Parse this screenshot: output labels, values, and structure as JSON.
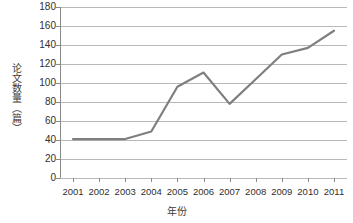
{
  "chart_data": {
    "type": "line",
    "title": "",
    "xlabel": "年份",
    "ylabel": "论文数量（篇）",
    "categories": [
      "2001",
      "2002",
      "2003",
      "2004",
      "2005",
      "2006",
      "2007",
      "2008",
      "2009",
      "2010",
      "2011"
    ],
    "values": [
      41,
      41,
      41,
      49,
      96,
      111,
      78,
      104,
      130,
      137,
      155
    ],
    "series": [
      {
        "name": "论文数量",
        "values": [
          41,
          41,
          41,
          49,
          96,
          111,
          78,
          104,
          130,
          137,
          155
        ],
        "color": "#7f7f7f"
      }
    ],
    "ylim": [
      0,
      180
    ],
    "ytick_step": 20,
    "yticks": [
      0,
      20,
      40,
      60,
      80,
      100,
      120,
      140,
      160,
      180
    ],
    "ytick_labels": [
      "0",
      "20",
      "40",
      "60",
      "80",
      "100",
      "120",
      "140",
      "160",
      "180"
    ],
    "grid": true,
    "grid_axis": "y",
    "legend": false,
    "legend_position": "none",
    "markers": false,
    "colors": {
      "line": "#7f7f7f",
      "grid": "#b8b8b8",
      "axis": "#8a8a8a",
      "text": "#2f2f2f",
      "background": "#ffffff"
    }
  }
}
